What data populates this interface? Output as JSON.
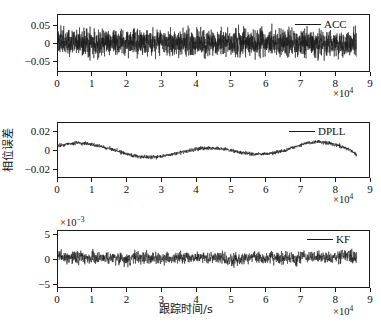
{
  "figure": {
    "background_color": "#ffffff",
    "line_color": "#1a1a1a",
    "axis_color": "#1a1a1a"
  },
  "chart_data": [
    {
      "type": "line",
      "name": "acc-phase-error",
      "title": "",
      "xlabel": "",
      "ylabel": "",
      "legend": [
        "ACC"
      ],
      "legend_position": "top-right",
      "grid": false,
      "x_multiplier": "×10",
      "x_exponent": "4",
      "y_multiplier": "",
      "y_exponent": "",
      "xlim": [
        0,
        9
      ],
      "ylim": [
        -0.075,
        0.075
      ],
      "xticks": [
        0,
        1,
        2,
        3,
        4,
        5,
        6,
        7,
        8,
        9
      ],
      "xticklabels": [
        "0",
        "1",
        "2",
        "3",
        "4",
        "5",
        "6",
        "7",
        "8",
        "9"
      ],
      "yticks": [
        -0.05,
        0,
        0.05
      ],
      "yticklabels": [
        "−0.05",
        "0",
        "0.05"
      ],
      "series": [
        {
          "name": "ACC",
          "description": "zero-mean broadband noise, data spans x 0 to 8.64",
          "x_start": 0,
          "x_end": 8.64,
          "mean": 0.0,
          "noise_amplitude": 0.03,
          "envelope_values": [
            0.03,
            0.03,
            0.029,
            0.031,
            0.03,
            0.03,
            0.031,
            0.029,
            0.03,
            0.03,
            0.031,
            0.03,
            0.029,
            0.03,
            0.031,
            0.03,
            0.03,
            0.029,
            0.031,
            0.03
          ]
        }
      ]
    },
    {
      "type": "line",
      "name": "dpll-phase-error",
      "title": "",
      "xlabel": "",
      "ylabel": "相位误差",
      "legend": [
        "DPLL"
      ],
      "legend_position": "top-right",
      "grid": false,
      "x_multiplier": "×10",
      "x_exponent": "4",
      "y_multiplier": "",
      "y_exponent": "",
      "xlim": [
        0,
        9
      ],
      "ylim": [
        -0.03,
        0.03
      ],
      "xticks": [
        0,
        1,
        2,
        3,
        4,
        5,
        6,
        7,
        8,
        9
      ],
      "xticklabels": [
        "0",
        "1",
        "2",
        "3",
        "4",
        "5",
        "6",
        "7",
        "8",
        "9"
      ],
      "yticks": [
        -0.02,
        0,
        0.02
      ],
      "yticklabels": [
        "−0.02",
        "0",
        "0.02"
      ],
      "series": [
        {
          "name": "DPLL",
          "description": "slow sinusoidal drift with superimposed noise, data spans x 0 to 8.64",
          "x_start": 0,
          "x_end": 8.64,
          "noise_amplitude": 0.0018,
          "trend_x": [
            0.0,
            0.3,
            0.6,
            0.9,
            1.2,
            1.5,
            1.8,
            2.1,
            2.4,
            2.7,
            3.0,
            3.3,
            3.6,
            3.9,
            4.2,
            4.5,
            4.8,
            5.1,
            5.4,
            5.7,
            6.0,
            6.3,
            6.6,
            6.9,
            7.2,
            7.5,
            7.8,
            8.1,
            8.4,
            8.64
          ],
          "trend_y": [
            0.0045,
            0.007,
            0.0075,
            0.0068,
            0.0045,
            0.0015,
            -0.002,
            -0.0055,
            -0.0078,
            -0.008,
            -0.0068,
            -0.0048,
            -0.0022,
            0.0002,
            0.002,
            0.0022,
            0.001,
            -0.0012,
            -0.0035,
            -0.0048,
            -0.0045,
            -0.0028,
            0.0,
            0.004,
            0.008,
            0.0092,
            0.008,
            0.005,
            0.001,
            -0.005
          ]
        }
      ]
    },
    {
      "type": "line",
      "name": "kf-phase-error",
      "title": "",
      "xlabel": "跟踪时间/s",
      "ylabel": "",
      "legend": [
        "KF"
      ],
      "legend_position": "top-right",
      "grid": false,
      "x_multiplier": "×10",
      "x_exponent": "4",
      "y_multiplier": "×10",
      "y_exponent": "−3",
      "xlim": [
        0,
        9
      ],
      "ylim": [
        -5.8,
        5.8
      ],
      "xticks": [
        0,
        1,
        2,
        3,
        4,
        5,
        6,
        7,
        8,
        9
      ],
      "xticklabels": [
        "0",
        "1",
        "2",
        "3",
        "4",
        "5",
        "6",
        "7",
        "8",
        "9"
      ],
      "yticks": [
        -5,
        0,
        5
      ],
      "yticklabels": [
        "−5",
        "0",
        "5"
      ],
      "series": [
        {
          "name": "KF",
          "description": "low-amplitude noise about zero with small wandering baseline, data spans x 0 to 8.64, units 1e-3",
          "x_start": 0,
          "x_end": 8.64,
          "noise_amplitude": 1.1,
          "trend_x": [
            0.0,
            0.3,
            0.6,
            0.9,
            1.2,
            1.5,
            1.8,
            2.1,
            2.4,
            2.7,
            3.0,
            3.3,
            3.6,
            3.9,
            4.2,
            4.5,
            4.8,
            5.1,
            5.4,
            5.7,
            6.0,
            6.3,
            6.6,
            6.9,
            7.2,
            7.5,
            7.8,
            8.1,
            8.4,
            8.64
          ],
          "trend_y": [
            0.6,
            0.3,
            0.2,
            0.4,
            0.1,
            0.2,
            0.3,
            0.1,
            0.4,
            0.2,
            0.0,
            0.3,
            0.5,
            0.2,
            0.1,
            0.3,
            0.2,
            -0.3,
            0.1,
            0.3,
            0.2,
            0.4,
            0.3,
            0.1,
            0.5,
            0.4,
            -0.1,
            0.3,
            0.6,
            0.4
          ]
        }
      ]
    }
  ]
}
